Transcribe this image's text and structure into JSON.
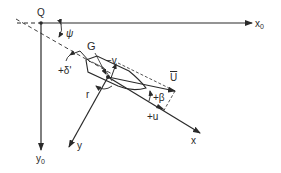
{
  "diagram": {
    "type": "ship-maneuvering-coordinate-system",
    "stroke_color": "#2a2a2a",
    "labels": {
      "origin": "Q",
      "x0_axis": "x",
      "x0_sub": "0",
      "y0_axis": "y",
      "y0_sub": "0",
      "heading_angle": "ψ",
      "rudder_angle": "+δ'",
      "center_of_gravity": "G",
      "sway_velocity": "−v",
      "yaw_rate": "r",
      "velocity": "U",
      "drift_angle": "+β",
      "surge_velocity": "+u",
      "body_x_axis": "x",
      "body_y_axis": "y"
    },
    "nodes": [
      {
        "id": "Q",
        "label": "Q",
        "role": "earth-fixed origin"
      },
      {
        "id": "G",
        "label": "G",
        "role": "ship center of gravity"
      }
    ],
    "axes": [
      {
        "id": "x0",
        "from": "Q",
        "direction": "right",
        "label": "x0"
      },
      {
        "id": "y0",
        "from": "Q",
        "direction": "down",
        "label": "y0"
      },
      {
        "id": "x",
        "from": "G",
        "direction": "ship heading",
        "label": "x"
      },
      {
        "id": "y",
        "from": "G",
        "direction": "starboard",
        "label": "y"
      }
    ]
  }
}
